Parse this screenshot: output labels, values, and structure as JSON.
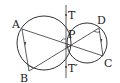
{
  "diagram": {
    "colors": {
      "stroke": "#333333",
      "background": "#ffffff"
    },
    "labels": {
      "A": "A",
      "B": "B",
      "C": "C",
      "D": "D",
      "P": "P",
      "T": "T",
      "T_prime": "T′"
    },
    "circles": [
      {
        "name": "left-circle",
        "cx": 44,
        "cy": 43,
        "r": 27
      },
      {
        "name": "right-circle",
        "cx": 87,
        "cy": 43,
        "r": 20
      }
    ],
    "points": {
      "A": [
        22,
        29
      ],
      "B": [
        29,
        71
      ],
      "C": [
        103,
        56
      ],
      "D": [
        99,
        28
      ],
      "P": [
        66,
        43
      ]
    },
    "segments": [
      [
        "A",
        "B"
      ],
      [
        "A",
        "C"
      ],
      [
        "B",
        "D"
      ],
      [
        "D",
        "C"
      ]
    ],
    "tangent_line": {
      "x": 66,
      "y1": 5,
      "y2": 78
    }
  }
}
